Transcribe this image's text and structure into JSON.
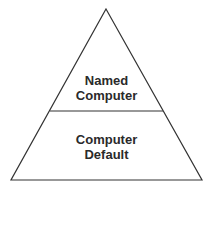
{
  "diagram": {
    "type": "pyramid",
    "levels": [
      {
        "lines": [
          "Named",
          "Computer"
        ]
      },
      {
        "lines": [
          "Computer",
          "Default"
        ]
      }
    ],
    "stroke_color": "#333333"
  }
}
